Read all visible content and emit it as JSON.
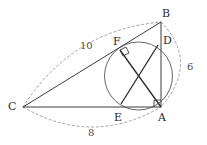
{
  "figure": {
    "kind": "geometry-diagram",
    "stroke_color": "#3c3c3c",
    "dash_color": "#8d8d8d",
    "circle_color": "#555555",
    "canvas": {
      "width": 207,
      "height": 145
    }
  },
  "vertices": [
    {
      "name": "B",
      "label": "B",
      "x": 161,
      "y": 22,
      "label_x": 162,
      "label_y": 8
    },
    {
      "name": "D",
      "label": "D",
      "x": 158,
      "y": 45,
      "label_x": 163,
      "label_y": 35
    },
    {
      "name": "F",
      "label": "F",
      "x": 120,
      "y": 50,
      "label_x": 113,
      "label_y": 36
    },
    {
      "name": "A",
      "label": "A",
      "x": 161,
      "y": 107,
      "label_x": 158,
      "label_y": 112
    },
    {
      "name": "E",
      "label": "E",
      "x": 121,
      "y": 104,
      "label_x": 114,
      "label_y": 112
    },
    {
      "name": "C",
      "label": "C",
      "x": 23,
      "y": 107,
      "label_x": 8,
      "label_y": 101
    }
  ],
  "side_labels": [
    {
      "name": "side-cb",
      "text": "10",
      "x": 80,
      "y": 41
    },
    {
      "name": "side-ca",
      "text": "8",
      "x": 88,
      "y": 128
    },
    {
      "name": "side-ab",
      "text": "6",
      "x": 187,
      "y": 62
    }
  ],
  "circle": {
    "cx": 138.5,
    "cy": 76,
    "r": 34
  },
  "segments": [
    {
      "name": "segment-cb",
      "from": "C",
      "to": "B"
    },
    {
      "name": "segment-ca",
      "from": "C",
      "to": "A"
    },
    {
      "name": "segment-ba",
      "from": "B",
      "to": "A"
    },
    {
      "name": "chord-fa",
      "from": "F",
      "to": "A"
    },
    {
      "name": "chord-de",
      "from": "D",
      "to": "E"
    }
  ],
  "right_angles": [
    {
      "name": "right-angle-at-a",
      "x": 161,
      "y": 107
    },
    {
      "name": "right-angle-at-f",
      "x": 120,
      "y": 50
    }
  ]
}
